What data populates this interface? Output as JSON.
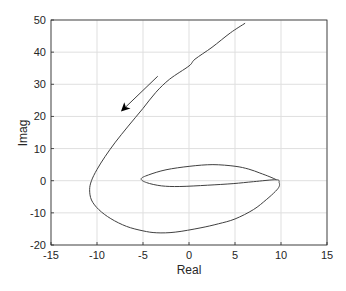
{
  "chart_data": {
    "type": "line",
    "title": "",
    "xlabel": "Real",
    "ylabel": "Imag",
    "xlim": [
      -15,
      15
    ],
    "ylim": [
      -20,
      50
    ],
    "xticks": [
      -15,
      -10,
      -5,
      0,
      5,
      10,
      15
    ],
    "yticks": [
      -20,
      -10,
      0,
      10,
      20,
      30,
      40,
      50
    ],
    "xtick_labels": [
      "-15",
      "-10",
      "-5",
      "0",
      "5",
      "10",
      "15"
    ],
    "ytick_labels": [
      "-20",
      "-10",
      "0",
      "10",
      "20",
      "30",
      "40",
      "50"
    ],
    "grid": true,
    "legend": null,
    "series": [
      {
        "name": "nyquist-curve",
        "color": "#404040",
        "points": [
          [
            6.1,
            49.0
          ],
          [
            4.5,
            46.0
          ],
          [
            2.5,
            41.5
          ],
          [
            0.65,
            37.8
          ],
          [
            0.0,
            35.7
          ],
          [
            -2.1,
            31.6
          ],
          [
            -3.6,
            27.5
          ],
          [
            -5.0,
            22.5
          ],
          [
            -6.6,
            17.0
          ],
          [
            -8.0,
            12.0
          ],
          [
            -9.1,
            7.6
          ],
          [
            -10.0,
            3.5
          ],
          [
            -10.6,
            0.0
          ],
          [
            -10.8,
            -2.8
          ],
          [
            -10.6,
            -6.0
          ],
          [
            -9.8,
            -9.0
          ],
          [
            -8.5,
            -11.8
          ],
          [
            -6.8,
            -14.2
          ],
          [
            -5.0,
            -15.6
          ],
          [
            -3.5,
            -16.2
          ],
          [
            -1.5,
            -16.0
          ],
          [
            1.2,
            -14.7
          ],
          [
            3.2,
            -13.4
          ],
          [
            5.0,
            -11.9
          ],
          [
            7.0,
            -9.0
          ],
          [
            8.4,
            -5.9
          ],
          [
            9.4,
            -3.3
          ],
          [
            9.8,
            -1.8
          ],
          [
            9.8,
            -0.6
          ],
          [
            9.5,
            0.3
          ],
          [
            7.0,
            -0.3
          ],
          [
            4.8,
            -0.9
          ],
          [
            2.0,
            -1.4
          ],
          [
            -1.0,
            -1.8
          ],
          [
            -3.0,
            -1.6
          ],
          [
            -4.6,
            -0.6
          ],
          [
            -5.2,
            0.6
          ],
          [
            -4.4,
            1.8
          ],
          [
            -2.5,
            3.4
          ],
          [
            0.1,
            4.5
          ],
          [
            2.6,
            5.0
          ],
          [
            5.0,
            4.5
          ],
          [
            6.5,
            3.6
          ],
          [
            7.7,
            2.4
          ],
          [
            8.8,
            1.2
          ],
          [
            9.5,
            0.3
          ]
        ]
      }
    ],
    "annotations": [
      {
        "type": "arrow",
        "from": [
          -3.4,
          32.5
        ],
        "to": [
          -7.4,
          21.5
        ],
        "color": "#000000",
        "meaning": "direction of increasing frequency"
      }
    ]
  },
  "colors": {
    "background": "#ffffff",
    "axes_box": "#262626",
    "grid": "#dfdfdf",
    "curve": "#404040",
    "arrow": "#000000",
    "text": "#262626"
  }
}
